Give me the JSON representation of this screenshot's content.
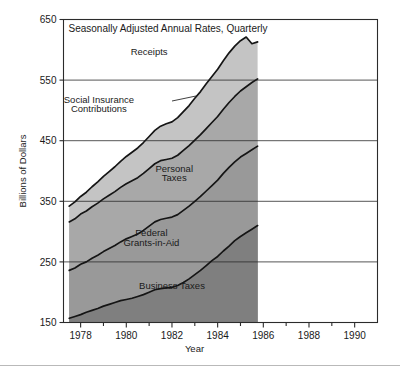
{
  "chart_data": {
    "type": "area",
    "title": "Seasonally Adjusted Annual Rates, Quarterly",
    "xlabel": "Year",
    "ylabel": "Billions of Dollars",
    "xlim": [
      1977.25,
      1991.0
    ],
    "ylim": [
      150,
      650
    ],
    "grid": true,
    "grid_axis": "y",
    "stacked": true,
    "legend_position": "inline-annotations",
    "x_ticks": [
      1978,
      1980,
      1982,
      1984,
      1986,
      1988,
      1990
    ],
    "x_tick_labels": [
      "1978",
      "1980",
      "1982",
      "1984",
      "1986",
      "1988",
      "1990"
    ],
    "x_minor_ticks": [
      1979,
      1981,
      1983,
      1985,
      1987,
      1989
    ],
    "y_ticks": [
      150,
      250,
      350,
      450,
      550,
      650
    ],
    "y_tick_labels": [
      "150",
      "250",
      "350",
      "450",
      "550",
      "650"
    ],
    "x": [
      1977.5,
      1977.75,
      1978.0,
      1978.25,
      1978.5,
      1978.75,
      1979.0,
      1979.25,
      1979.5,
      1979.75,
      1980.0,
      1980.25,
      1980.5,
      1980.75,
      1981.0,
      1981.25,
      1981.5,
      1981.75,
      1982.0,
      1982.25,
      1982.5,
      1982.75,
      1983.0,
      1983.25,
      1983.5,
      1983.75,
      1984.0,
      1984.25,
      1984.5,
      1984.75,
      1985.0,
      1985.25,
      1985.5,
      1985.75
    ],
    "series": [
      {
        "name": "Business Taxes",
        "color": "#7f7f7f",
        "values": [
          157,
          160,
          163,
          167,
          170,
          173,
          177,
          180,
          183,
          186,
          188,
          190,
          193,
          196,
          200,
          204,
          206,
          207,
          208,
          211,
          216,
          222,
          229,
          236,
          244,
          252,
          259,
          268,
          276,
          285,
          292,
          298,
          304,
          310
        ]
      },
      {
        "name": "Federal Grants-in-Aid",
        "color": "#999999",
        "values": [
          236,
          240,
          246,
          250,
          256,
          261,
          267,
          272,
          277,
          283,
          288,
          292,
          296,
          302,
          309,
          316,
          320,
          322,
          324,
          328,
          335,
          342,
          350,
          358,
          367,
          376,
          385,
          396,
          406,
          415,
          423,
          429,
          435,
          441
        ]
      },
      {
        "name": "Personal Taxes",
        "color": "#a8a8a8",
        "values": [
          316,
          321,
          329,
          334,
          341,
          347,
          354,
          360,
          366,
          373,
          379,
          384,
          389,
          396,
          404,
          412,
          417,
          419,
          421,
          426,
          434,
          442,
          451,
          460,
          470,
          480,
          490,
          502,
          513,
          523,
          532,
          539,
          546,
          552
        ]
      },
      {
        "name": "Social Insurance Contributions",
        "color": "#c4c4c4",
        "values": [
          342,
          349,
          358,
          365,
          374,
          382,
          391,
          399,
          407,
          416,
          424,
          431,
          438,
          447,
          457,
          467,
          474,
          478,
          481,
          488,
          498,
          508,
          520,
          531,
          544,
          556,
          568,
          582,
          595,
          606,
          615,
          621,
          610,
          613
        ]
      }
    ],
    "annotations": [
      {
        "text": "Receipts",
        "x": 1981.0,
        "y": 592
      },
      {
        "text": "Social Insurance",
        "x": 1978.8,
        "y": 512
      },
      {
        "text": "Contributions",
        "x": 1978.8,
        "y": 497
      },
      {
        "text": "Personal",
        "x": 1982.1,
        "y": 398
      },
      {
        "text": "Taxes",
        "x": 1982.1,
        "y": 383
      },
      {
        "text": "Federal",
        "x": 1981.1,
        "y": 292
      },
      {
        "text": "Grants-in-Aid",
        "x": 1981.1,
        "y": 277
      },
      {
        "text": "Business Taxes",
        "x": 1982.0,
        "y": 205
      }
    ]
  },
  "axis": {
    "y_title": "Billions of Dollars",
    "x_title": "Year"
  }
}
